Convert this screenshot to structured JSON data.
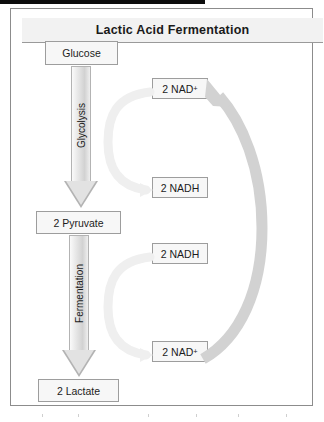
{
  "diagram": {
    "title": "Lactic Acid Fermentation",
    "left_flow": {
      "nodes": [
        {
          "id": "glucose",
          "label": "Glucose"
        },
        {
          "id": "pyruvate",
          "label": "2 Pyruvate"
        },
        {
          "id": "lactate",
          "label": "2 Lactate"
        }
      ],
      "arrows": [
        {
          "id": "glycolysis",
          "label": "Glycolysis",
          "direction": "down"
        },
        {
          "id": "fermentation",
          "label": "Fermentation",
          "direction": "down"
        }
      ]
    },
    "cofactors": [
      {
        "id": "nad-top",
        "base": "2 NAD",
        "charge": "+",
        "label": "2 NAD+"
      },
      {
        "id": "nadh-upper",
        "base": "2 NADH",
        "charge": "",
        "label": "2 NADH"
      },
      {
        "id": "nadh-lower",
        "base": "2 NADH",
        "charge": "",
        "label": "2 NADH"
      },
      {
        "id": "nad-bottom",
        "base": "2 NAD",
        "charge": "+",
        "label": "2 NAD+"
      }
    ],
    "curved_arrows": [
      {
        "id": "glycolysis-cofactor-curve",
        "from": "nad-top",
        "to": "nadh-upper",
        "style": "faint-c-curve"
      },
      {
        "id": "fermentation-cofactor-curve",
        "from": "nadh-lower",
        "to": "nad-bottom",
        "style": "faint-c-curve"
      },
      {
        "id": "nad-regeneration-curve",
        "from": "nad-bottom",
        "to": "nad-top",
        "style": "thick-gray-arc"
      }
    ],
    "colors": {
      "panel_border": "#8c8c8c",
      "title_background": "#f2f2f2",
      "box_fill": "#f7f7f7",
      "box_border": "#9d9d9d",
      "block_arrow_fill": "#e2e2e2",
      "thick_arc": "#d2d2d2",
      "faint_arc": "#efefef",
      "text": "#1c1c1c"
    }
  }
}
